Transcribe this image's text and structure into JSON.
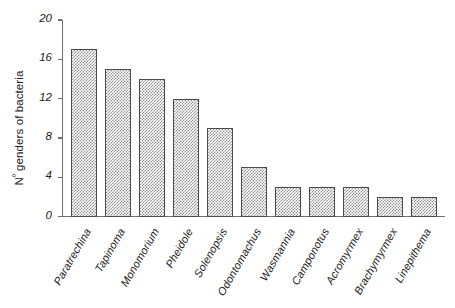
{
  "chart_data": {
    "type": "bar",
    "title": "",
    "xlabel": "",
    "ylabel": "Nº genders of bacteria",
    "ylabel_prefix": "N",
    "ylabel_sup": "º",
    "ylabel_rest": " genders of bacteria",
    "categories": [
      "Paratrechina",
      "Tapinoma",
      "Monomorium",
      "Pheidole",
      "Solenopsis",
      "Odontomachus",
      "Wasmannia",
      "Camponotus",
      "Acromyrmex",
      "Brachymyrmex",
      "Linepithema"
    ],
    "values": [
      17,
      15,
      14,
      12,
      9,
      5,
      3,
      3,
      3,
      2,
      2
    ],
    "ylim": [
      0,
      20
    ],
    "yticks": [
      0,
      4,
      8,
      12,
      16,
      20
    ],
    "ytick_labels": [
      "0",
      "4",
      "8",
      "12",
      "16",
      "20"
    ],
    "grid": false,
    "legend": false,
    "legend_position": "none",
    "bar_fill_color": "#909090",
    "bar_edge_color": "#4a4a4a",
    "bar_pattern": "crosshatch",
    "axis_color": "#6f6f6f",
    "background_color": "#ffffff"
  }
}
